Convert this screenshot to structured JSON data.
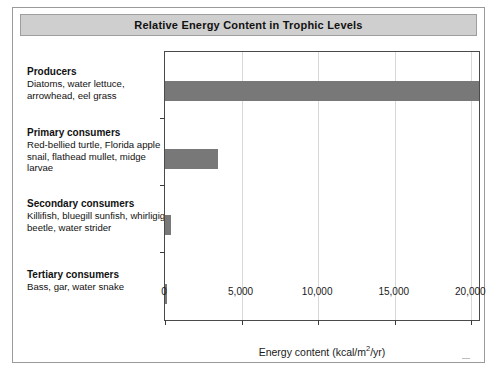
{
  "figure": {
    "title": "Relative Energy Content in Trophic Levels"
  },
  "chart_data": {
    "type": "bar",
    "orientation": "horizontal",
    "title": "Relative Energy Content in Trophic Levels",
    "xlabel": "Energy content (kcal/m2/yr)",
    "xlabel_prefix": "Energy content (kcal/m",
    "xlabel_sup": "2",
    "xlabel_suffix": "/yr)",
    "ylabel": "",
    "xlim": [
      0,
      20500
    ],
    "xticks": [
      0,
      5000,
      10000,
      15000,
      20000
    ],
    "xticklabels": [
      "0",
      "5,000",
      "10,000",
      "15,000",
      "20,000"
    ],
    "grid": "vertical",
    "legend": "none",
    "bar_color": "#787878",
    "categories": [
      "Producers",
      "Primary consumers",
      "Secondary consumers",
      "Tertiary consumers"
    ],
    "values": [
      20500,
      3480,
      380,
      90
    ],
    "points": [
      {
        "category": "Producers",
        "species": "Diatoms, water lettuce, arrowhead, eel grass",
        "value": 20500
      },
      {
        "category": "Primary consumers",
        "species": "Red-bellied turtle, Florida apple snail, flathead mullet, midge larvae",
        "value": 3480
      },
      {
        "category": "Secondary consumers",
        "species": "Killifish, bluegill sunfish, whirligig beetle, water strider",
        "value": 380
      },
      {
        "category": "Tertiary consumers",
        "species": "Bass, gar, water snake",
        "value": 90
      }
    ]
  },
  "labels": {
    "producers": {
      "name": "Producers",
      "species": "Diatoms, water lettuce, arrowhead, eel grass"
    },
    "primary": {
      "name": "Primary consumers",
      "species": "Red-bellied turtle, Florida apple snail, flathead mullet, midge larvae"
    },
    "secondary": {
      "name": "Secondary consumers",
      "species": "Killifish, bluegill sunfish, whirligig beetle, water strider"
    },
    "tertiary": {
      "name": "Tertiary consumers",
      "species": "Bass, gar, water snake"
    }
  }
}
